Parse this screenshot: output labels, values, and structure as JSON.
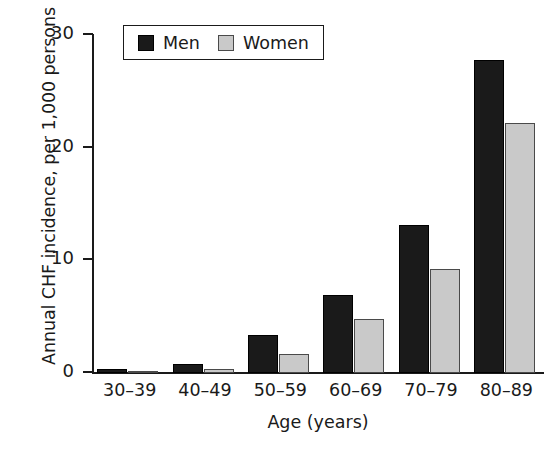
{
  "chart_data": {
    "type": "bar",
    "title": "",
    "xlabel": "Age (years)",
    "ylabel": "Annual CHF incidence, per 1,000 persons",
    "categories": [
      "30–39",
      "40–49",
      "50–59",
      "60–69",
      "70–79",
      "80–89"
    ],
    "series": [
      {
        "name": "Men",
        "color": "#1a1a1a",
        "values": [
          0.4,
          0.8,
          3.4,
          6.9,
          13.1,
          27.8
        ]
      },
      {
        "name": "Women",
        "color": "#c9c9c9",
        "values": [
          0.2,
          0.4,
          1.7,
          4.8,
          9.2,
          22.2
        ]
      }
    ],
    "ylim": [
      0,
      30
    ],
    "yticks": [
      0,
      10,
      20,
      30
    ],
    "ytick_labels": [
      "0",
      "10",
      "20",
      "30"
    ],
    "grid": false,
    "legend_position": "top-left-inside"
  },
  "axes": {
    "y_title": "Annual CHF incidence, per 1,000 persons",
    "x_title": "Age (years)"
  },
  "legend": {
    "entries": [
      {
        "label": "Men",
        "swatch": "black-square-swatch"
      },
      {
        "label": "Women",
        "swatch": "gray-square-swatch"
      }
    ]
  },
  "caption": {
    "fragment": ""
  }
}
